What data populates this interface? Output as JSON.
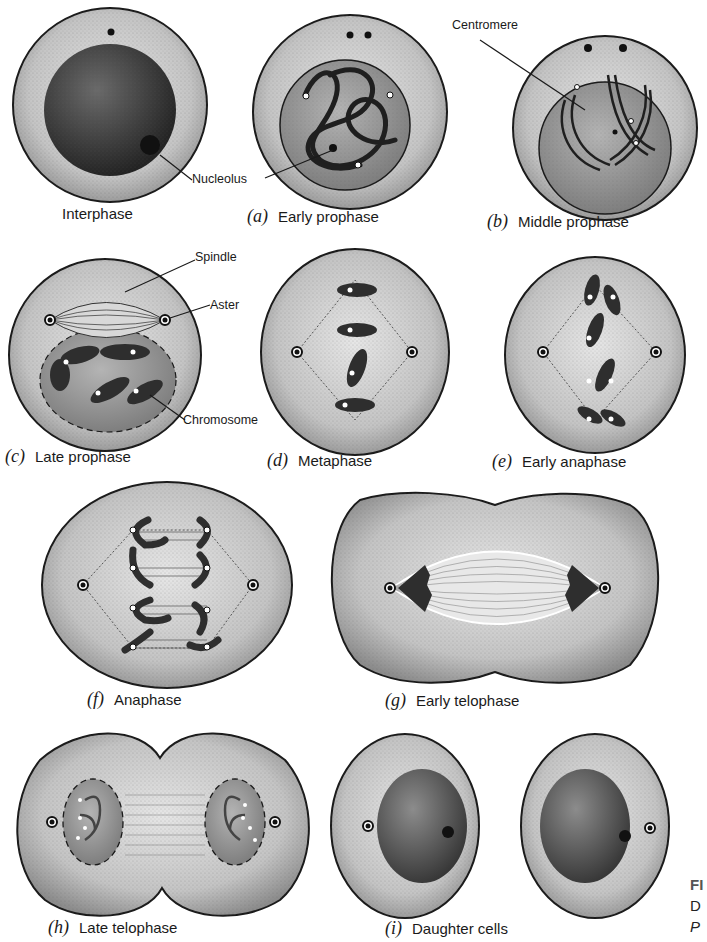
{
  "figure": {
    "stages": [
      {
        "letter": "",
        "label": "Interphase"
      },
      {
        "letter": "(a)",
        "label": "Early prophase"
      },
      {
        "letter": "(b)",
        "label": "Middle prophase"
      },
      {
        "letter": "(c)",
        "label": "Late prophase"
      },
      {
        "letter": "(d)",
        "label": "Metaphase"
      },
      {
        "letter": "(e)",
        "label": "Early anaphase"
      },
      {
        "letter": "(f)",
        "label": "Anaphase"
      },
      {
        "letter": "(g)",
        "label": "Early telophase"
      },
      {
        "letter": "(h)",
        "label": "Late telophase"
      },
      {
        "letter": "(i)",
        "label": "Daughter cells"
      }
    ],
    "callouts": {
      "nucleolus": "Nucleolus",
      "centromere": "Centromere",
      "spindle": "Spindle",
      "aster": "Aster",
      "chromosome": "Chromosome"
    },
    "caption_fragment": {
      "line1": "FI",
      "line2": "D",
      "line3": "P"
    },
    "colors": {
      "outline": "#1a1a1a",
      "cytoplasm": "#cfcfcf",
      "nucleus": "#8a8a8a",
      "chromosome": "#333333",
      "background": "#ffffff"
    }
  }
}
